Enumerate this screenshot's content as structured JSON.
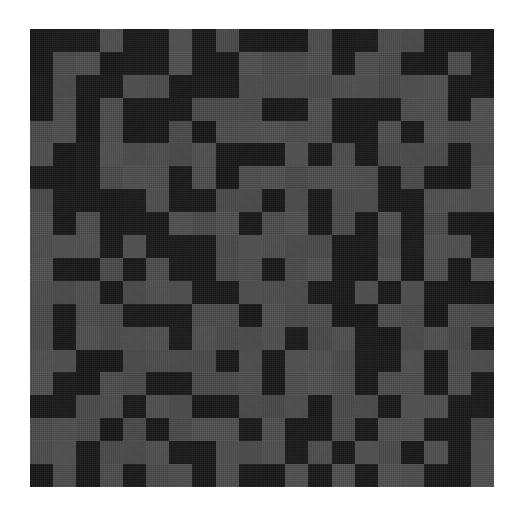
{
  "figure": {
    "background_color": "#ffffff",
    "plate": {
      "x": 30,
      "y": 29,
      "width": 464,
      "height": 458
    }
  },
  "chart_data": {
    "type": "heatmap",
    "title": "",
    "subtitle": "",
    "xlabel": "",
    "ylabel": "",
    "rows": 20,
    "cols": 20,
    "grid": false,
    "legend_position": "none",
    "colorbar": false,
    "value_levels": [
      0,
      1
    ],
    "level_colors": [
      "#1a1a1a",
      "#4d4d4d"
    ],
    "level_labels": [
      "dark",
      "light"
    ],
    "cell_width_px": 23.2,
    "cell_height_px": 22.9,
    "x": [
      0,
      1,
      2,
      3,
      4,
      5,
      6,
      7,
      8,
      9,
      10,
      11,
      12,
      13,
      14,
      15,
      16,
      17,
      18,
      19
    ],
    "y": [
      0,
      1,
      2,
      3,
      4,
      5,
      6,
      7,
      8,
      9,
      10,
      11,
      12,
      13,
      14,
      15,
      16,
      17,
      18,
      19
    ],
    "xtick_labels": [],
    "ytick_labels": [],
    "values": [
      [
        0,
        0,
        0,
        1,
        0,
        0,
        1,
        0,
        1,
        0,
        0,
        0,
        1,
        0,
        0,
        1,
        1,
        0,
        0,
        0
      ],
      [
        0,
        1,
        1,
        0,
        0,
        0,
        1,
        0,
        0,
        1,
        1,
        1,
        1,
        0,
        1,
        1,
        0,
        0,
        1,
        0
      ],
      [
        0,
        1,
        0,
        0,
        1,
        1,
        0,
        0,
        0,
        1,
        1,
        1,
        1,
        1,
        1,
        1,
        1,
        1,
        0,
        0
      ],
      [
        0,
        1,
        0,
        1,
        0,
        0,
        0,
        1,
        1,
        1,
        0,
        0,
        1,
        0,
        0,
        0,
        1,
        1,
        0,
        1
      ],
      [
        1,
        1,
        0,
        1,
        0,
        0,
        1,
        0,
        1,
        1,
        1,
        1,
        1,
        0,
        0,
        1,
        0,
        1,
        1,
        1
      ],
      [
        1,
        0,
        0,
        1,
        1,
        1,
        1,
        1,
        0,
        0,
        0,
        1,
        0,
        1,
        0,
        1,
        1,
        1,
        0,
        1
      ],
      [
        0,
        0,
        0,
        1,
        1,
        1,
        0,
        1,
        0,
        1,
        1,
        1,
        1,
        1,
        1,
        0,
        1,
        0,
        0,
        1
      ],
      [
        1,
        0,
        0,
        0,
        0,
        1,
        0,
        0,
        1,
        1,
        0,
        1,
        0,
        1,
        1,
        0,
        0,
        1,
        1,
        1
      ],
      [
        1,
        0,
        1,
        0,
        0,
        0,
        1,
        1,
        1,
        0,
        1,
        1,
        0,
        1,
        0,
        1,
        0,
        1,
        0,
        0
      ],
      [
        1,
        1,
        1,
        0,
        1,
        0,
        0,
        0,
        1,
        1,
        1,
        1,
        1,
        0,
        0,
        1,
        0,
        1,
        1,
        0
      ],
      [
        1,
        0,
        0,
        1,
        0,
        1,
        0,
        0,
        1,
        1,
        0,
        1,
        1,
        0,
        0,
        1,
        0,
        1,
        0,
        1
      ],
      [
        1,
        1,
        1,
        0,
        1,
        1,
        1,
        0,
        0,
        1,
        1,
        1,
        0,
        0,
        1,
        0,
        1,
        0,
        0,
        0
      ],
      [
        1,
        0,
        1,
        1,
        0,
        0,
        0,
        1,
        1,
        0,
        1,
        1,
        1,
        0,
        0,
        1,
        1,
        0,
        1,
        1
      ],
      [
        1,
        0,
        1,
        1,
        1,
        1,
        0,
        1,
        1,
        1,
        1,
        0,
        1,
        1,
        0,
        0,
        1,
        1,
        1,
        0
      ],
      [
        1,
        1,
        0,
        0,
        1,
        1,
        1,
        1,
        0,
        1,
        0,
        1,
        1,
        1,
        0,
        0,
        1,
        0,
        1,
        1
      ],
      [
        1,
        0,
        0,
        1,
        1,
        0,
        0,
        1,
        1,
        1,
        0,
        1,
        1,
        1,
        0,
        1,
        1,
        0,
        1,
        0
      ],
      [
        0,
        0,
        1,
        1,
        0,
        1,
        1,
        0,
        0,
        1,
        1,
        1,
        0,
        1,
        1,
        0,
        1,
        1,
        0,
        0
      ],
      [
        1,
        1,
        1,
        0,
        1,
        0,
        1,
        1,
        1,
        0,
        1,
        0,
        0,
        1,
        0,
        1,
        1,
        0,
        0,
        1
      ],
      [
        1,
        1,
        0,
        1,
        1,
        1,
        0,
        0,
        1,
        1,
        1,
        0,
        1,
        0,
        1,
        1,
        0,
        1,
        0,
        1
      ],
      [
        0,
        1,
        0,
        1,
        0,
        1,
        1,
        0,
        1,
        0,
        0,
        1,
        0,
        1,
        0,
        1,
        1,
        0,
        0,
        1
      ]
    ]
  }
}
